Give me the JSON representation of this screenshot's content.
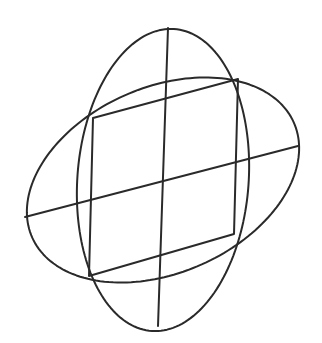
{
  "figure": {
    "width": 322,
    "height": 343,
    "background": "#ffffff",
    "stroke_color": "#2a2a2a",
    "stroke_width": 2,
    "center": [
      163,
      180
    ],
    "parallelogram": {
      "corners": [
        [
          93,
          118
        ],
        [
          238,
          79
        ],
        [
          234,
          234
        ],
        [
          89,
          276
        ]
      ]
    },
    "diameters": {
      "vertical": [
        [
          168,
          28
        ],
        [
          158,
          326
        ]
      ],
      "horizontal": [
        [
          25,
          217
        ],
        [
          298,
          146
        ]
      ]
    },
    "ellipses": [
      {
        "name": "tall-ellipse",
        "half_diameter_u": [
          5,
          -151
        ],
        "half_diameter_v": [
          86,
          -5
        ]
      },
      {
        "name": "wide-ellipse",
        "half_diameter_u": [
          136,
          -36
        ],
        "half_diameter_v": [
          -6,
          -96
        ]
      }
    ]
  }
}
